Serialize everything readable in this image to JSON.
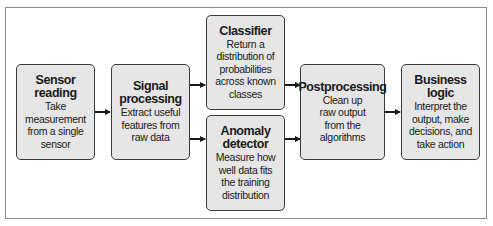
{
  "diagram": {
    "type": "flowchart",
    "direction": "left-to-right",
    "nodes": [
      {
        "id": "sensor",
        "title": "Sensor reading",
        "title_lines": [
          "Sensor",
          "reading"
        ],
        "description_lines": [
          "Take",
          "measurement",
          "from a single",
          "sensor"
        ]
      },
      {
        "id": "signal",
        "title": "Signal processing",
        "title_lines": [
          "Signal",
          "processing"
        ],
        "description_lines": [
          "Extract useful",
          "features from",
          "raw data"
        ]
      },
      {
        "id": "classifier",
        "title": "Classifier",
        "title_lines": [
          "Classifier"
        ],
        "description_lines": [
          "Return a",
          "distribution of",
          "probabilities",
          "across known",
          "classes"
        ]
      },
      {
        "id": "anomaly",
        "title": "Anomaly detector",
        "title_lines": [
          "Anomaly",
          "detector"
        ],
        "description_lines": [
          "Measure how",
          "well data fits",
          "the training",
          "distribution"
        ]
      },
      {
        "id": "post",
        "title": "Postprocessing",
        "title_lines": [
          "Postprocessing"
        ],
        "description_lines": [
          "Clean up",
          "raw output",
          "from the",
          "algorithms"
        ]
      },
      {
        "id": "business",
        "title": "Business logic",
        "title_lines": [
          "Business logic"
        ],
        "description_lines": [
          "Interpret the",
          "output, make",
          "decisions, and",
          "take action"
        ]
      }
    ],
    "edges": [
      {
        "from": "sensor",
        "to": "signal"
      },
      {
        "from": "signal",
        "to": "classifier"
      },
      {
        "from": "signal",
        "to": "anomaly"
      },
      {
        "from": "classifier",
        "to": "post"
      },
      {
        "from": "anomaly",
        "to": "post"
      },
      {
        "from": "post",
        "to": "business"
      }
    ],
    "colors": {
      "box_fill": "#e6e6e6",
      "box_border": "#3a3a3a",
      "arrow": "#1a1a1a",
      "frame": "#8a8a8a"
    }
  }
}
